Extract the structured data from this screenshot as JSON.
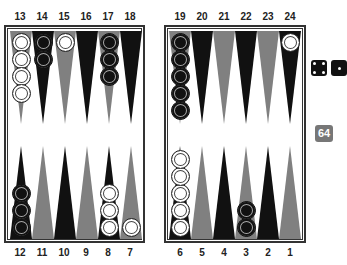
{
  "board": {
    "top_labels": [
      "13",
      "14",
      "15",
      "16",
      "17",
      "18",
      "19",
      "20",
      "21",
      "22",
      "23",
      "24"
    ],
    "bottom_labels": [
      "12",
      "11",
      "10",
      "9",
      "8",
      "7",
      "6",
      "5",
      "4",
      "3",
      "2",
      "1"
    ],
    "colors": {
      "dark_point": "#111111",
      "light_point": "#808080",
      "frame": "#333333",
      "white_checker": "#ffffff",
      "black_checker": "#111111"
    },
    "points": [
      {
        "num": 13,
        "color": "light",
        "checkers": {
          "color": "white",
          "count": 4
        }
      },
      {
        "num": 14,
        "color": "dark",
        "checkers": {
          "color": "black",
          "count": 2
        }
      },
      {
        "num": 15,
        "color": "light",
        "checkers": {
          "color": "white",
          "count": 1
        }
      },
      {
        "num": 16,
        "color": "dark",
        "checkers": null
      },
      {
        "num": 17,
        "color": "light",
        "checkers": {
          "color": "black",
          "count": 3
        }
      },
      {
        "num": 18,
        "color": "dark",
        "checkers": null
      },
      {
        "num": 19,
        "color": "light",
        "checkers": {
          "color": "black",
          "count": 5
        }
      },
      {
        "num": 20,
        "color": "dark",
        "checkers": null
      },
      {
        "num": 21,
        "color": "light",
        "checkers": null
      },
      {
        "num": 22,
        "color": "dark",
        "checkers": null
      },
      {
        "num": 23,
        "color": "light",
        "checkers": null
      },
      {
        "num": 24,
        "color": "dark",
        "checkers": {
          "color": "white",
          "count": 1
        }
      },
      {
        "num": 12,
        "color": "dark",
        "checkers": {
          "color": "black",
          "count": 3
        }
      },
      {
        "num": 11,
        "color": "light",
        "checkers": null
      },
      {
        "num": 10,
        "color": "dark",
        "checkers": null
      },
      {
        "num": 9,
        "color": "light",
        "checkers": null
      },
      {
        "num": 8,
        "color": "dark",
        "checkers": {
          "color": "white",
          "count": 3
        }
      },
      {
        "num": 7,
        "color": "light",
        "checkers": {
          "color": "white",
          "count": 1
        }
      },
      {
        "num": 6,
        "color": "dark",
        "checkers": {
          "color": "white",
          "count": 5
        }
      },
      {
        "num": 5,
        "color": "light",
        "checkers": null
      },
      {
        "num": 4,
        "color": "dark",
        "checkers": null
      },
      {
        "num": 3,
        "color": "light",
        "checkers": {
          "color": "black",
          "count": 2
        }
      },
      {
        "num": 2,
        "color": "dark",
        "checkers": null
      },
      {
        "num": 1,
        "color": "light",
        "checkers": null
      }
    ]
  },
  "dice": [
    {
      "value": 4
    },
    {
      "value": "partially visible"
    }
  ],
  "doubling_cube": {
    "value": "64"
  }
}
